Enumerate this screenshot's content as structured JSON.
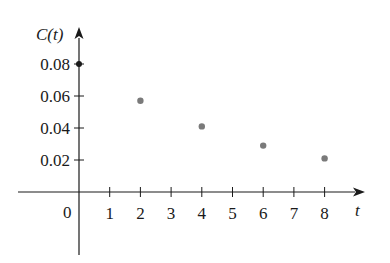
{
  "chart_data": {
    "type": "scatter",
    "title": "",
    "xlabel": "t",
    "ylabel": "C(t)",
    "x": [
      0,
      2,
      4,
      6,
      8
    ],
    "values": [
      0.08,
      0.057,
      0.041,
      0.029,
      0.021
    ],
    "xlim": [
      -2.5,
      9.5
    ],
    "ylim": [
      -0.045,
      0.1
    ],
    "x_ticks": [
      1,
      2,
      3,
      4,
      5,
      6,
      7,
      8
    ],
    "y_ticks": [
      0.02,
      0.04,
      0.06,
      0.08
    ],
    "grid": false,
    "legend": null
  },
  "labels": {
    "y_axis": "C(t)",
    "x_axis": "t",
    "origin": "0",
    "x_ticks": [
      "1",
      "2",
      "3",
      "4",
      "5",
      "6",
      "7",
      "8"
    ],
    "y_ticks": [
      "0.02",
      "0.04",
      "0.06",
      "0.08"
    ]
  },
  "colors": {
    "axis": "#1a1a1a",
    "point": "#7a7a7a"
  }
}
